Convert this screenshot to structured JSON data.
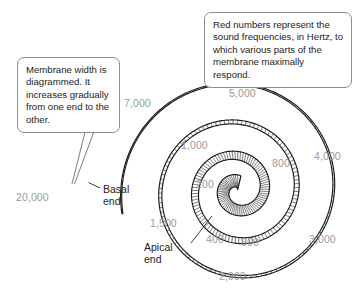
{
  "figure": {
    "type": "cochlea-basilar-membrane-spiral-diagram",
    "callouts": [
      {
        "id": "membrane-width-note",
        "text": "Membrane width is diagrammed. It increases gradually from one end to the other."
      },
      {
        "id": "red-numbers-note",
        "text": "Red numbers represent the sound frequencies, in Hertz, to which various parts of the membrane maximally respond."
      }
    ],
    "end_labels": [
      {
        "id": "basal",
        "line1": "Basal",
        "line2": "end"
      },
      {
        "id": "apical",
        "line1": "Apical",
        "line2": "end"
      }
    ],
    "frequency_color": "#9b9b9b",
    "frequency_labels": [
      {
        "value": "20,000"
      },
      {
        "value": "7,000"
      },
      {
        "value": "5,000"
      },
      {
        "value": "4,000"
      },
      {
        "value": "3,000"
      },
      {
        "value": "2,000"
      },
      {
        "value": "1,500"
      },
      {
        "value": "1,000"
      },
      {
        "value": "800"
      },
      {
        "value": "600"
      },
      {
        "value": "400"
      },
      {
        "value": "200"
      }
    ]
  }
}
